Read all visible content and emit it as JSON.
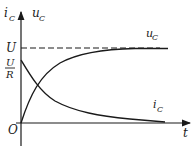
{
  "diagram": {
    "axes": {
      "y_label_current": "i",
      "y_label_current_sub": "C",
      "y_label_voltage": "u",
      "y_label_voltage_sub": "C",
      "x_label": "t",
      "origin_label": "O"
    },
    "levels": {
      "voltage_level": "U",
      "current_level_num": "U",
      "current_level_den": "R"
    },
    "curves": [
      {
        "name": "u",
        "sub": "C",
        "shape": "rising exponential to U"
      },
      {
        "name": "i",
        "sub": "C",
        "shape": "decaying exponential from U/R"
      }
    ],
    "colors": {
      "ink": "#1a1a1a",
      "background": "#ffffff"
    }
  }
}
